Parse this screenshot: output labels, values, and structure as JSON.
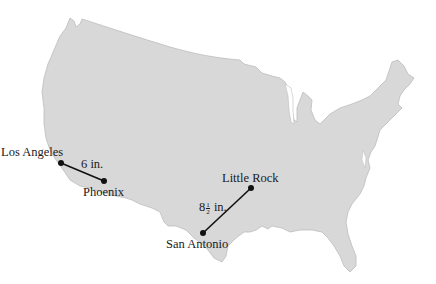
{
  "figure": {
    "type": "map",
    "region": "continental United States",
    "colors": {
      "land": "#d8d8d8",
      "coast": "#bdbdbd",
      "line": "#111111",
      "background": "#ffffff"
    },
    "cities": [
      {
        "name": "Los Angeles",
        "x": 61,
        "y": 163
      },
      {
        "name": "Phoenix",
        "x": 104,
        "y": 181
      },
      {
        "name": "Little Rock",
        "x": 251,
        "y": 188
      },
      {
        "name": "San Antonio",
        "x": 203,
        "y": 233
      }
    ],
    "segments": [
      {
        "from": "Los Angeles",
        "to": "Phoenix",
        "label": "6 in."
      },
      {
        "from": "San Antonio",
        "to": "Little Rock",
        "label_whole": "8",
        "label_num": "1",
        "label_den": "2",
        "label_unit": "in."
      }
    ]
  }
}
